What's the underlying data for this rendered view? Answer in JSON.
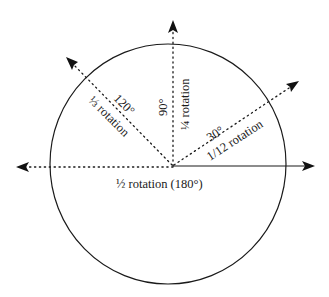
{
  "diagram": {
    "colors": {
      "ink": "#1a1a1a",
      "background": "#ffffff"
    },
    "circle": {
      "cx": 168,
      "cy": 164,
      "rx": 118,
      "ry": 120
    },
    "origin": {
      "x": 173,
      "y": 166
    },
    "rays": [
      {
        "id": "ray-0",
        "angle_deg": 0,
        "style": "solid",
        "tip": {
          "x": 315,
          "y": 166
        },
        "label": ""
      },
      {
        "id": "ray-30",
        "angle_deg": 30,
        "style": "dotted",
        "tip": {
          "x": 299,
          "y": 81
        },
        "degree_label": "30°",
        "fraction_label": "1/12 rotation"
      },
      {
        "id": "ray-90",
        "angle_deg": 90,
        "style": "dotted",
        "tip": {
          "x": 173,
          "y": 20
        },
        "degree_label": "90°",
        "fraction_label": "¼ rotation"
      },
      {
        "id": "ray-120",
        "angle_deg": 120,
        "style": "dotted",
        "tip": {
          "x": 66,
          "y": 57
        },
        "degree_label": "120°",
        "fraction_label": "⅓ rotation"
      },
      {
        "id": "ray-180",
        "angle_deg": 180,
        "style": "dotted",
        "tip": {
          "x": 16,
          "y": 167
        },
        "label": "½ rotation (180°)"
      }
    ]
  }
}
